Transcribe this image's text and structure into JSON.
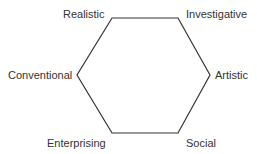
{
  "diagram": {
    "type": "hexagon",
    "stroke_color": "#333333",
    "background": "#ffffff",
    "vertices": [
      {
        "id": "realistic",
        "label": "Realistic",
        "x": 112,
        "y": 18
      },
      {
        "id": "investigative",
        "label": "Investigative",
        "x": 178,
        "y": 18
      },
      {
        "id": "artistic",
        "label": "Artistic",
        "x": 210,
        "y": 75
      },
      {
        "id": "social",
        "label": "Social",
        "x": 178,
        "y": 133
      },
      {
        "id": "enterprising",
        "label": "Enterprising",
        "x": 112,
        "y": 133
      },
      {
        "id": "conventional",
        "label": "Conventional",
        "x": 77,
        "y": 75
      }
    ],
    "labels": {
      "realistic": "Realistic",
      "investigative": "Investigative",
      "artistic": "Artistic",
      "social": "Social",
      "enterprising": "Enterprising",
      "conventional": "Conventional"
    }
  }
}
